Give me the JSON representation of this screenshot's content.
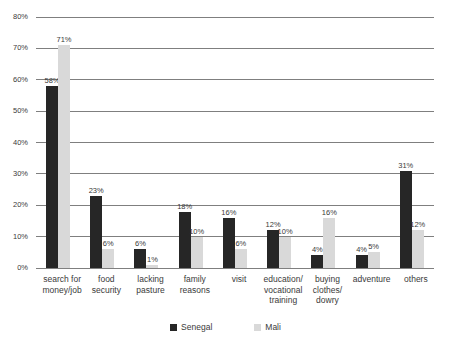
{
  "chart_data": {
    "type": "bar",
    "title": "",
    "subtitle": "",
    "xlabel": "",
    "ylabel": "",
    "ylim": [
      0,
      80
    ],
    "ytick_labels": [
      "0%",
      "10%",
      "20%",
      "30%",
      "40%",
      "50%",
      "60%",
      "70%",
      "80%"
    ],
    "ytick_values": [
      0,
      10,
      20,
      30,
      40,
      50,
      60,
      70,
      80
    ],
    "grid": "horizontal",
    "legend_position": "bottom-center",
    "value_label_suffix": "%",
    "categories": [
      "search for money/job",
      "food security",
      "lacking pasture",
      "family reasons",
      "visit",
      "education/ vocational training",
      "buying clothes/ dowry",
      "adventure",
      "others"
    ],
    "category_lines": [
      [
        "search for",
        "money/job"
      ],
      [
        "food",
        "security"
      ],
      [
        "lacking",
        "pasture"
      ],
      [
        "family",
        "reasons"
      ],
      [
        "visit"
      ],
      [
        "education/",
        "vocational",
        "training"
      ],
      [
        "buying",
        "clothes/",
        "dowry"
      ],
      [
        "adventure"
      ],
      [
        "others"
      ]
    ],
    "series": [
      {
        "name": "Senegal",
        "color": "#262626",
        "values": [
          58,
          23,
          6,
          18,
          16,
          12,
          4,
          4,
          31
        ],
        "labels": [
          "58%",
          "23%",
          "6%",
          "18%",
          "16%",
          "12%",
          "4%",
          "4%",
          "31%"
        ]
      },
      {
        "name": "Mali",
        "color": "#d9d9d9",
        "values": [
          71,
          6,
          1,
          10,
          6,
          10,
          16,
          5,
          12
        ],
        "labels": [
          "71%",
          "6%",
          "1%",
          "10%",
          "6%",
          "10%",
          "16%",
          "5%",
          "12%"
        ]
      }
    ]
  },
  "legend": {
    "items": [
      {
        "label": "Senegal",
        "color": "#262626"
      },
      {
        "label": "Mali",
        "color": "#d9d9d9"
      }
    ]
  }
}
